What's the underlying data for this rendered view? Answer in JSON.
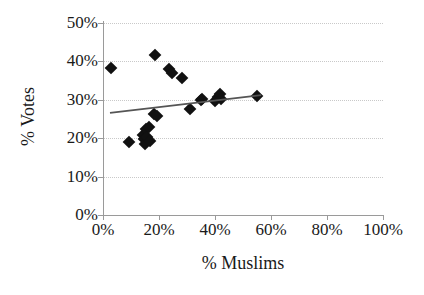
{
  "chart_data": {
    "type": "scatter",
    "title": "",
    "xlabel": "% Muslims",
    "ylabel": "% Votes",
    "xlim": [
      0,
      100
    ],
    "ylim": [
      0,
      50
    ],
    "xticks": [
      "0%",
      "20%",
      "40%",
      "60%",
      "80%",
      "100%"
    ],
    "xtick_values": [
      0,
      20,
      40,
      60,
      80,
      100
    ],
    "yticks": [
      "0%",
      "10%",
      "20%",
      "30%",
      "40%",
      "50%"
    ],
    "ytick_values": [
      0,
      10,
      20,
      30,
      40,
      50
    ],
    "grid": "horizontal",
    "legend": "none",
    "marker": "filled-diamond",
    "marker_color": "#111111",
    "gridline_color": "#c9c9c9",
    "axis_color": "#9a9a9a",
    "points": [
      {
        "x": 3.0,
        "y": 38.3
      },
      {
        "x": 9.3,
        "y": 19.1
      },
      {
        "x": 14.3,
        "y": 20.8
      },
      {
        "x": 14.6,
        "y": 19.8
      },
      {
        "x": 15.0,
        "y": 18.6
      },
      {
        "x": 15.4,
        "y": 22.4
      },
      {
        "x": 15.7,
        "y": 20.3
      },
      {
        "x": 16.4,
        "y": 23.0
      },
      {
        "x": 16.8,
        "y": 19.4
      },
      {
        "x": 18.2,
        "y": 26.4
      },
      {
        "x": 18.6,
        "y": 41.6
      },
      {
        "x": 19.3,
        "y": 25.7
      },
      {
        "x": 23.6,
        "y": 37.9
      },
      {
        "x": 24.6,
        "y": 37.0
      },
      {
        "x": 28.2,
        "y": 35.6
      },
      {
        "x": 31.1,
        "y": 27.6
      },
      {
        "x": 35.0,
        "y": 29.9
      },
      {
        "x": 35.4,
        "y": 30.1
      },
      {
        "x": 40.0,
        "y": 29.7
      },
      {
        "x": 41.1,
        "y": 30.6
      },
      {
        "x": 41.8,
        "y": 31.4
      },
      {
        "x": 42.1,
        "y": 30.2
      },
      {
        "x": 55.0,
        "y": 30.9
      }
    ],
    "trendline": {
      "type": "linear",
      "color": "#555555",
      "x_start": 2.5,
      "y_start": 26.6,
      "x_end": 56.5,
      "y_end": 31.2
    }
  }
}
